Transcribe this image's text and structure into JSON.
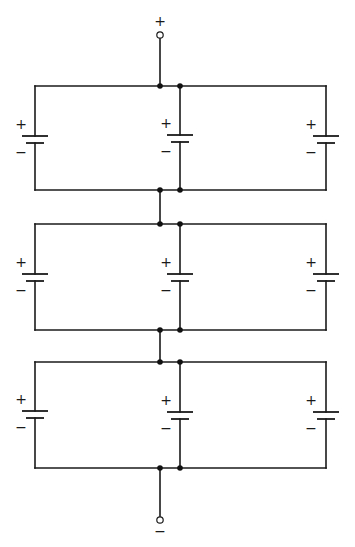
{
  "diagram": {
    "type": "circuit-schematic",
    "colors": {
      "line": "#1a1a1a",
      "background": "#ffffff",
      "junction": "#111111"
    },
    "terminals": {
      "positive": {
        "label": "+",
        "x": 160,
        "y": 35,
        "label_y": 22
      },
      "negative": {
        "label": "−",
        "x": 160,
        "y": 520,
        "label_y": 532
      }
    },
    "geometry": {
      "left_x": 35,
      "mid_x": 180,
      "right_x": 326,
      "connector_x": 160,
      "plate_long_half": 13,
      "plate_short_half": 9,
      "plate_gap": 7
    },
    "banks": [
      {
        "name": "bank-1",
        "top_y": 86,
        "bottom_y": 190,
        "cells": [
          {
            "position": "left",
            "x": 35,
            "plate_y": 136,
            "plus": "+",
            "minus": "−",
            "label_x": 21
          },
          {
            "position": "middle",
            "x": 180,
            "plate_y": 135,
            "plus": "+",
            "minus": "−",
            "label_x": 166
          },
          {
            "position": "right",
            "x": 326,
            "plate_y": 136,
            "plus": "+",
            "minus": "−",
            "label_x": 311
          }
        ]
      },
      {
        "name": "bank-2",
        "top_y": 224,
        "bottom_y": 330,
        "cells": [
          {
            "position": "left",
            "x": 35,
            "plate_y": 274,
            "plus": "+",
            "minus": "−",
            "label_x": 21
          },
          {
            "position": "middle",
            "x": 180,
            "plate_y": 274,
            "plus": "+",
            "minus": "−",
            "label_x": 166
          },
          {
            "position": "right",
            "x": 326,
            "plate_y": 274,
            "plus": "+",
            "minus": "−",
            "label_x": 311
          }
        ]
      },
      {
        "name": "bank-3",
        "top_y": 362,
        "bottom_y": 468,
        "cells": [
          {
            "position": "left",
            "x": 35,
            "plate_y": 411,
            "plus": "+",
            "minus": "−",
            "label_x": 21
          },
          {
            "position": "middle",
            "x": 180,
            "plate_y": 412,
            "plus": "+",
            "minus": "−",
            "label_x": 166
          },
          {
            "position": "right",
            "x": 326,
            "plate_y": 412,
            "plus": "+",
            "minus": "−",
            "label_x": 311
          }
        ]
      }
    ]
  }
}
